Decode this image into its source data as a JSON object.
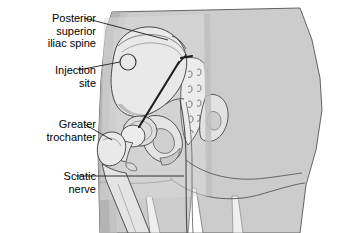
{
  "figure": {
    "background_color": "#ffffff",
    "body_fill_color": "#cccccc",
    "body_shadow_color": "#b4b4b4",
    "bone_fill_color": "#e9e9e9",
    "bone_shade_color": "#c3c3c3",
    "outline_color": "#3c3c3c",
    "needle_color": "#1e1e1e",
    "text_color": "#000000"
  },
  "labels": [
    {
      "id": "posterior-superior-iliac-spine",
      "lines": [
        "Posterior",
        "superior",
        "iliac spine"
      ],
      "leader": "from text to upper iliac crest marking"
    },
    {
      "id": "injection-site",
      "lines": [
        "Injection",
        "site"
      ],
      "leader": "from text to circled injection site on gluteal region"
    },
    {
      "id": "greater-trochanter",
      "lines": [
        "Greater",
        "trochanter"
      ],
      "leader": "from text to greater trochanter of femur"
    },
    {
      "id": "sciatic-nerve",
      "lines": [
        "Sciatic",
        "nerve"
      ],
      "leader": "from text across thigh to sciatic nerve path"
    }
  ],
  "markers": {
    "injection_site_circle": {
      "cx": 128,
      "cy": 62,
      "r": 8
    },
    "needle": {
      "x1": 179,
      "y1": 62,
      "x2": 139,
      "y2": 127
    }
  }
}
